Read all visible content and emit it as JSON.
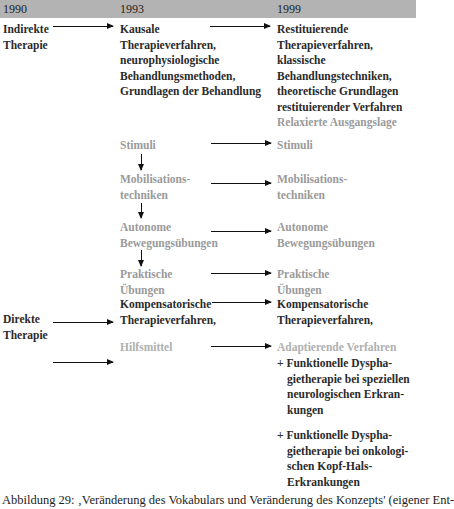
{
  "header": {
    "years": [
      "1990",
      "1993",
      "1999"
    ],
    "bar_color": "#b3b3b3"
  },
  "col1990": {
    "indirect": [
      "Indirekte",
      "Therapie"
    ],
    "direct": [
      "Direkte",
      "Therapie"
    ]
  },
  "col1993": {
    "kausale": [
      "Kausale",
      "Therapieverfahren,",
      "neurophysiologische",
      "Behandlungsmethoden,",
      "Grundlagen der Behandlung"
    ],
    "stimuli": "Stimuli",
    "mobilisation": [
      "Mobilisations-",
      "techniken"
    ],
    "autonome": [
      "Autonome",
      "Bewegungsübungen"
    ],
    "praktische": [
      "Praktische",
      "Übungen"
    ],
    "kompensatorisch": [
      "Kompensatorische",
      "Therapieverfahren,"
    ],
    "hilfsmittel": "Hilfsmittel"
  },
  "col1999": {
    "restituierende": [
      "Restituierende",
      "Therapieverfahren,",
      "klassische",
      "Behandlungstechniken,",
      "theoretische Grundlagen",
      "restituierender Verfahren"
    ],
    "relaxiert": "Relaxierte Ausgangslage",
    "stimuli": "Stimuli",
    "mobilisation": [
      "Mobilisations-",
      "techniken"
    ],
    "autonome": [
      "Autonome",
      "Bewegungsübungen"
    ],
    "praktische": [
      "Praktische",
      "Übungen"
    ],
    "kompensatorisch": [
      "Kompensatorische",
      "Therapieverfahren,"
    ],
    "adaptierend": "Adaptierende Verfahren",
    "funk1": [
      "+ Funktionelle Dyspha-",
      "gietherapie bei speziellen",
      "neurologischen Erkran-",
      "kungen"
    ],
    "funk2": [
      "+ Funktionelle Dyspha-",
      "gietherapie bei onkologi-",
      "schen Kopf-Hals-",
      "Erkrankungen"
    ]
  },
  "caption": "Abbildung 29:  ‚Veränderung des Vokabulars und Veränderung des Konzepts' (eigener Ent-"
}
